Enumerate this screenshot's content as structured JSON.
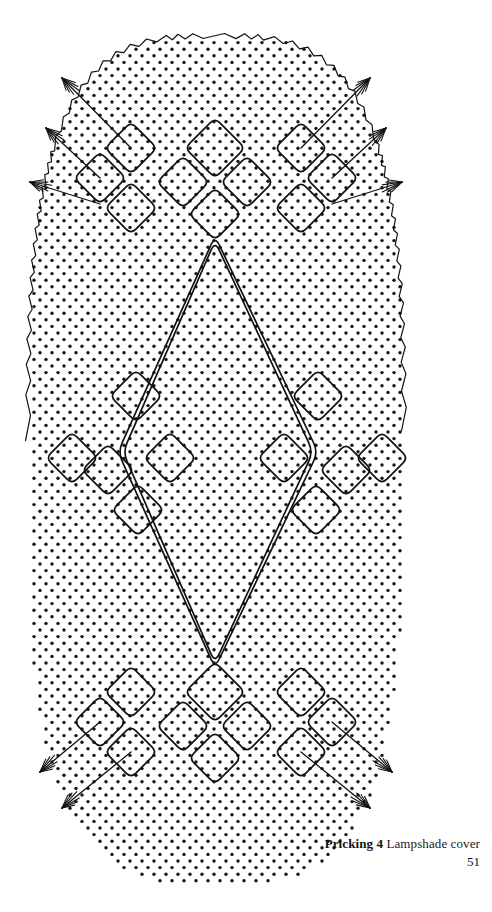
{
  "figure": {
    "kind": "bobbin-lace-pricking-diagram",
    "title_label": "Pricking 4",
    "title_text": "Lampshade cover",
    "page_number": "51",
    "ink_color": "#111111",
    "paper_color": "#ffffff",
    "dot_color": "#151515",
    "canvas": {
      "width": 492,
      "height": 912
    },
    "pricking_field": {
      "shape": "rounded-oval",
      "left": 28,
      "right": 404,
      "top": 36,
      "bottom": 884,
      "dot_radius": 1.7,
      "dot_spacing_x": 12,
      "dot_spacing_y": 6.6,
      "stagger": "offset-rows"
    },
    "border": {
      "style": "zigzag",
      "amplitude": 5,
      "wavelength": 11,
      "segments": "top-edge-and-upper-corners"
    },
    "motifs": {
      "diamond_corner_radius": 7,
      "stroke_width": 1.7,
      "large_center_diamond": {
        "top_apex_y": 236,
        "bottom_apex_y": 668,
        "left_x": 118,
        "right_x": 318,
        "double_line_gap": 5
      }
    },
    "arrows": {
      "head_style": "feathered",
      "top_left_count": 3,
      "top_right_count": 3,
      "bottom_left_count": 2,
      "bottom_right_count": 2
    }
  }
}
